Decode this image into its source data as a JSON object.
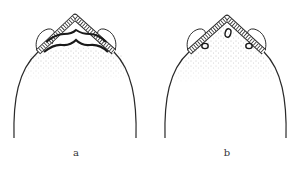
{
  "figures": [
    {
      "id": "a",
      "label": "a",
      "description": "head outline with two wavy transverse bands below banded arch"
    },
    {
      "id": "b",
      "label": "b",
      "description": "head outline with three small oval spots below banded arch"
    }
  ],
  "colors": {
    "ink": "#2a2a2a",
    "stipple": "#8a8a8a",
    "background": "#ffffff"
  }
}
